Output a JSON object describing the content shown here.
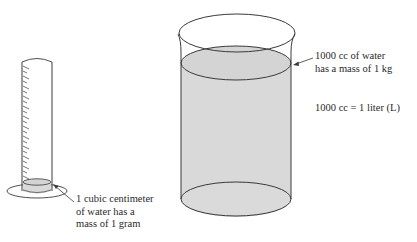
{
  "figure": {
    "graduated_cylinder": {
      "label_lines": [
        "1 cubic centimeter",
        "of water has a",
        "mass of 1 gram"
      ]
    },
    "beaker": {
      "label_lines": [
        "1000 cc of water",
        "has a mass of 1 kg"
      ]
    },
    "equivalence": {
      "text": "1000 cc = 1 liter (L)"
    },
    "colors": {
      "outline": "#3a3a3a",
      "water_fill": "#d9d9d9",
      "background": "#ffffff",
      "text": "#2a2a2a"
    }
  }
}
